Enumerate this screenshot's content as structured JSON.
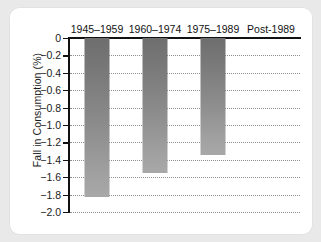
{
  "chart_data": {
    "type": "bar",
    "title": "",
    "subtitle": "",
    "xlabel": "",
    "ylabel": "Fall in Consumption (%)",
    "categories": [
      "1945–1959",
      "1960–1974",
      "1975–1989",
      "Post-1989"
    ],
    "values": [
      -1.83,
      -1.55,
      -1.35,
      0
    ],
    "ylim": [
      -2.0,
      0
    ],
    "yticks": [
      0,
      -0.2,
      -0.4,
      -0.6,
      -0.8,
      -1.0,
      -1.2,
      -1.4,
      -1.6,
      -1.8,
      -2.0
    ],
    "ytick_labels": [
      "0",
      "−0.2",
      "−0.4",
      "−0.6",
      "−0.8",
      "−1.0",
      "−1.2",
      "−1.4",
      "−1.6",
      "−1.8",
      "−2.0"
    ],
    "grid": true,
    "grid_style": "dotted",
    "legend": false,
    "legend_position": "none",
    "bar_color_top": "#6e6e6e",
    "bar_color_bottom": "#a8a8a8",
    "axis_color": "#111111",
    "grid_color": "#8e8e8e",
    "background": "#ffffff",
    "page_background": "#e9e9e9",
    "annotations": []
  }
}
